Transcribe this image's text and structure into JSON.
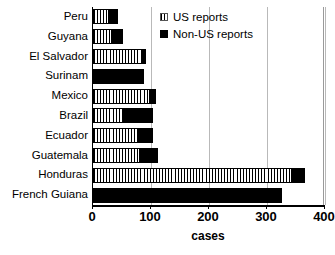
{
  "chart_data": {
    "type": "bar",
    "orientation": "horizontal",
    "stacked": true,
    "title": "",
    "xlabel": "cases",
    "ylabel": "",
    "xlim": [
      0,
      400
    ],
    "xticks": [
      0,
      100,
      200,
      300,
      400
    ],
    "xtick_labels": [
      "0",
      "100",
      "200",
      "300",
      "400"
    ],
    "grid": "vertical",
    "legend_position": "top-center",
    "categories": [
      "Peru",
      "Guyana",
      "El Salvador",
      "Surinam",
      "Mexico",
      "Brazil",
      "Ecuador",
      "Guatemala",
      "Honduras",
      "French Guiana"
    ],
    "series": [
      {
        "name": "US reports",
        "fill": "vertical-stripes",
        "values": [
          26,
          31,
          83,
          0,
          97,
          52,
          78,
          79,
          342,
          0
        ]
      },
      {
        "name": "Non-US reports",
        "fill": "solid-black",
        "values": [
          17,
          21,
          9,
          88,
          12,
          52,
          26,
          33,
          24,
          326
        ]
      }
    ],
    "totals": [
      43,
      52,
      92,
      88,
      109,
      104,
      104,
      112,
      366,
      326
    ]
  },
  "legend": {
    "items": [
      {
        "label": "US reports",
        "swatch": "striped-swatch-icon"
      },
      {
        "label": "Non-US reports",
        "swatch": "black-swatch-icon"
      }
    ]
  },
  "axis": {
    "x_title": "cases"
  }
}
